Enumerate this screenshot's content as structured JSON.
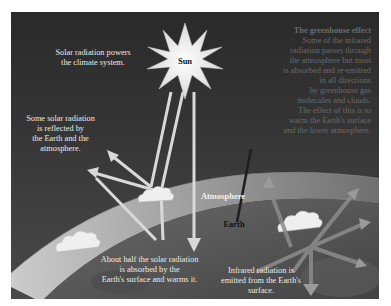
{
  "diagram": {
    "title": "The greenhouse effect",
    "colors": {
      "background": "#2e2e2e",
      "earth": "#555555",
      "atmosphere_band": "#bdbdbd",
      "sun": "#f4f4f4",
      "label_text": "#ecebe6",
      "dim_text": "#6a6a6a"
    },
    "nodes": {
      "sun": "Sun",
      "atmosphere": "Atmosphere",
      "earth": "Earth"
    },
    "labels": {
      "solar_powers": [
        "Solar radiation powers",
        "the climate system."
      ],
      "reflected": [
        "Some solar radiation",
        "is reflected by",
        "the Earth and the",
        "atmosphere."
      ],
      "absorbed": [
        "About half the solar radiation",
        "is absorbed by the",
        "Earth's surface and warms it."
      ],
      "infrared": [
        "Infrared radiation is",
        "emitted from the Earth's",
        "surface."
      ],
      "greenhouse": {
        "heading": "The greenhouse effect",
        "lines": [
          "Some of the infrared",
          "radiation passes through",
          "the atmosphere but most",
          "is absorbed and re-emitted",
          "in all directions",
          "by greenhouse gas",
          "molecules and clouds.",
          "The effect of this is to",
          "warm the Earth's surface",
          "and the lower atmosphere."
        ]
      }
    }
  }
}
